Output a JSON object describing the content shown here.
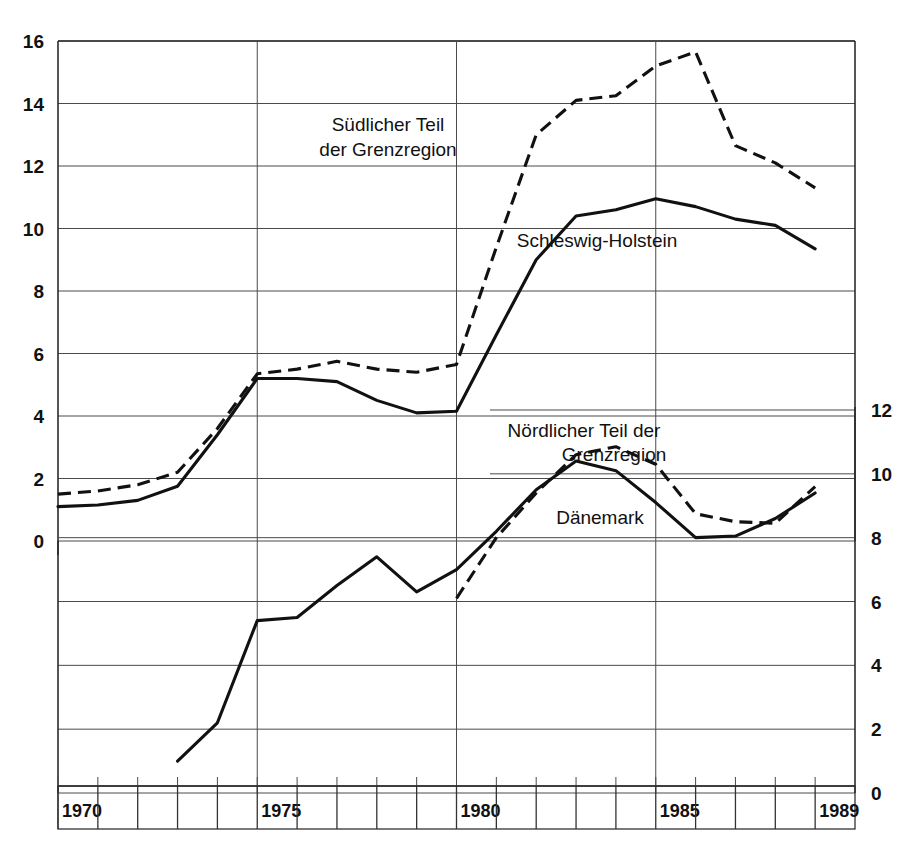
{
  "chart_data": {
    "type": "line",
    "title": "",
    "xlabel": "",
    "ylabel": "",
    "x": [
      1970,
      1971,
      1972,
      1973,
      1974,
      1975,
      1976,
      1977,
      1978,
      1979,
      1980,
      1981,
      1982,
      1983,
      1984,
      1985,
      1986,
      1987,
      1988,
      1989
    ],
    "top_panel": {
      "ylim": [
        0,
        16
      ],
      "yticks": [
        0,
        2,
        4,
        6,
        8,
        10,
        12,
        14,
        16
      ],
      "ytick_labels": [
        "0",
        "2",
        "4",
        "6",
        "8",
        "10",
        "12",
        "14",
        "16"
      ],
      "grid": true,
      "series": [
        {
          "name": "Südlicher Teil der Grenzregion",
          "style": "dashed",
          "x": [
            1970,
            1971,
            1972,
            1973,
            1974,
            1975,
            1976,
            1977,
            1978,
            1979,
            1980,
            1981,
            1982,
            1983,
            1984,
            1985,
            1986,
            1987,
            1988,
            1989
          ],
          "values": [
            1.5,
            1.6,
            1.8,
            2.2,
            3.6,
            5.35,
            5.5,
            5.75,
            5.5,
            5.4,
            5.65,
            9.4,
            13.0,
            14.1,
            14.25,
            15.2,
            15.65,
            12.65,
            12.1,
            11.3
          ]
        },
        {
          "name": "Schleswig-Holstein",
          "style": "solid",
          "x": [
            1970,
            1971,
            1972,
            1973,
            1974,
            1975,
            1976,
            1977,
            1978,
            1979,
            1980,
            1981,
            1982,
            1983,
            1984,
            1985,
            1986,
            1987,
            1988,
            1989
          ],
          "values": [
            1.1,
            1.15,
            1.3,
            1.75,
            3.4,
            5.2,
            5.2,
            5.1,
            4.5,
            4.1,
            4.15,
            6.6,
            9.0,
            10.4,
            10.6,
            10.95,
            10.7,
            10.3,
            10.1,
            9.35
          ]
        }
      ]
    },
    "bottom_panel": {
      "ylim": [
        0,
        12
      ],
      "yticks": [
        0,
        2,
        4,
        6,
        8,
        10,
        12
      ],
      "ytick_labels": [
        "0",
        "2",
        "4",
        "6",
        "8",
        "10",
        "12"
      ],
      "grid": true,
      "axis_position": "right",
      "series": [
        {
          "name": "Nördlicher Teil der Grenzregion",
          "style": "dashed",
          "x": [
            1980,
            1981,
            1982,
            1983,
            1984,
            1985,
            1986,
            1987,
            1988,
            1989
          ],
          "values": [
            6.1,
            8.0,
            9.4,
            10.6,
            10.85,
            10.3,
            8.75,
            8.5,
            8.45,
            9.6
          ]
        },
        {
          "name": "Dänemark",
          "style": "solid",
          "x": [
            1973,
            1974,
            1975,
            1976,
            1977,
            1978,
            1979,
            1980,
            1981,
            1982,
            1983,
            1984,
            1985,
            1986,
            1987,
            1988,
            1989
          ],
          "values": [
            1.0,
            2.2,
            5.4,
            5.5,
            6.5,
            7.4,
            6.3,
            7.0,
            8.2,
            9.5,
            10.4,
            10.1,
            9.1,
            8.0,
            8.05,
            8.6,
            9.4
          ]
        }
      ]
    },
    "annotations": [
      {
        "text": "Südlicher Teil",
        "x": 388,
        "y": 131
      },
      {
        "text": "der Grenzregion",
        "x": 388,
        "y": 156
      },
      {
        "text": "Schleswig-Holstein",
        "x": 597,
        "y": 247
      },
      {
        "text": "Nördlicher Teil der",
        "x": 584,
        "y": 437
      },
      {
        "text": "Grenzregion",
        "x": 614,
        "y": 461
      },
      {
        "text": "Dänemark",
        "x": 600,
        "y": 524
      }
    ],
    "x_axis_boxes": [
      {
        "year": 1970,
        "label": "1970"
      },
      {
        "year": 1971,
        "label": ""
      },
      {
        "year": 1972,
        "label": ""
      },
      {
        "year": 1973,
        "label": ""
      },
      {
        "year": 1974,
        "label": ""
      },
      {
        "year": 1975,
        "label": "1975"
      },
      {
        "year": 1976,
        "label": ""
      },
      {
        "year": 1977,
        "label": ""
      },
      {
        "year": 1978,
        "label": ""
      },
      {
        "year": 1979,
        "label": ""
      },
      {
        "year": 1980,
        "label": "1980"
      },
      {
        "year": 1981,
        "label": ""
      },
      {
        "year": 1982,
        "label": ""
      },
      {
        "year": 1983,
        "label": ""
      },
      {
        "year": 1984,
        "label": ""
      },
      {
        "year": 1985,
        "label": "1985"
      },
      {
        "year": 1986,
        "label": ""
      },
      {
        "year": 1987,
        "label": ""
      },
      {
        "year": 1988,
        "label": ""
      },
      {
        "year": 1989,
        "label": "1989"
      }
    ],
    "vertical_markers": [
      1975,
      1980,
      1985
    ],
    "colors": {
      "line": "#111111",
      "grid": "#4a4a4a",
      "axis": "#2b2b2b",
      "background": "#ffffff"
    }
  }
}
